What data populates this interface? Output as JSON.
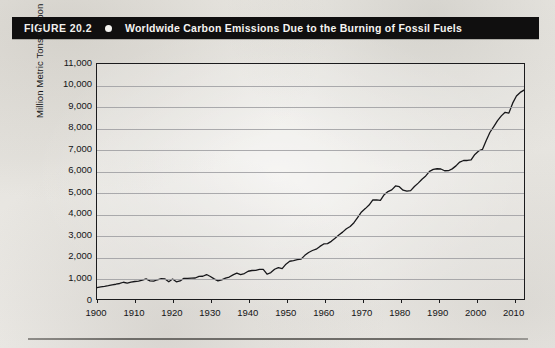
{
  "figure": {
    "number_label": "FIGURE 20.2",
    "bullet": "bullet-dot",
    "title": "Worldwide Carbon Emissions Due to the Burning of Fossil Fuels"
  },
  "colors": {
    "header_background": "#100f0f",
    "header_text": "#f6f5f2",
    "page_background": "#e9e7e2",
    "axis": "#1b1b1d",
    "gridline": "#9d9da1",
    "series_line": "#17171a"
  },
  "chart_data": {
    "type": "line",
    "title": "Worldwide Carbon Emissions Due to the Burning of Fossil Fuels",
    "xlabel": "",
    "ylabel": "Million Metric Tons Carbon",
    "xlim": [
      1900,
      2013
    ],
    "ylim": [
      0,
      11000
    ],
    "ytick_labels": [
      "0",
      "1,000",
      "2,000",
      "3,000",
      "4,000",
      "5,000",
      "6,000",
      "7,000",
      "8,000",
      "9,000",
      "10,000",
      "11,000"
    ],
    "ytick_values": [
      0,
      1000,
      2000,
      3000,
      4000,
      5000,
      6000,
      7000,
      8000,
      9000,
      10000,
      11000
    ],
    "xtick_labels": [
      "1900",
      "1910",
      "1920",
      "1930",
      "1940",
      "1950",
      "1960",
      "1970",
      "1980",
      "1990",
      "2000",
      "2010"
    ],
    "xtick_values": [
      1900,
      1910,
      1920,
      1930,
      1940,
      1950,
      1960,
      1970,
      1980,
      1990,
      2000,
      2010
    ],
    "grid": "horizontal",
    "legend": "none",
    "series": [
      {
        "name": "Worldwide carbon emissions from fossil fuels",
        "x": [
          1900,
          1901,
          1902,
          1903,
          1904,
          1905,
          1906,
          1907,
          1908,
          1909,
          1910,
          1911,
          1912,
          1913,
          1914,
          1915,
          1916,
          1917,
          1918,
          1919,
          1920,
          1921,
          1922,
          1923,
          1924,
          1925,
          1926,
          1927,
          1928,
          1929,
          1930,
          1931,
          1932,
          1933,
          1934,
          1935,
          1936,
          1937,
          1938,
          1939,
          1940,
          1941,
          1942,
          1943,
          1944,
          1945,
          1946,
          1947,
          1948,
          1949,
          1950,
          1951,
          1952,
          1953,
          1954,
          1955,
          1956,
          1957,
          1958,
          1959,
          1960,
          1961,
          1962,
          1963,
          1964,
          1965,
          1966,
          1967,
          1968,
          1969,
          1970,
          1971,
          1972,
          1973,
          1974,
          1975,
          1976,
          1977,
          1978,
          1979,
          1980,
          1981,
          1982,
          1983,
          1984,
          1985,
          1986,
          1987,
          1988,
          1989,
          1990,
          1991,
          1992,
          1993,
          1994,
          1995,
          1996,
          1997,
          1998,
          1999,
          2000,
          2001,
          2002,
          2003,
          2004,
          2005,
          2006,
          2007,
          2008,
          2009,
          2010,
          2011,
          2012,
          2013
        ],
        "values": [
          534,
          566,
          592,
          624,
          663,
          691,
          726,
          784,
          747,
          787,
          819,
          836,
          879,
          943,
          850,
          838,
          901,
          955,
          936,
          806,
          932,
          803,
          845,
          970,
          963,
          975,
          983,
          1062,
          1065,
          1145,
          1053,
          940,
          847,
          893,
          973,
          1027,
          1130,
          1209,
          1142,
          1192,
          1299,
          1334,
          1342,
          1391,
          1383,
          1160,
          1238,
          1392,
          1469,
          1419,
          1630,
          1767,
          1795,
          1841,
          1865,
          2043,
          2177,
          2270,
          2330,
          2462,
          2577,
          2594,
          2700,
          2848,
          2995,
          3130,
          3288,
          3393,
          3572,
          3824,
          4076,
          4231,
          4399,
          4635,
          4644,
          4615,
          4883,
          5029,
          5110,
          5292,
          5256,
          5093,
          5045,
          5072,
          5265,
          5424,
          5607,
          5760,
          5974,
          6067,
          6097,
          6085,
          6003,
          6005,
          6091,
          6231,
          6411,
          6483,
          6484,
          6508,
          6766,
          6929,
          6999,
          7424,
          7806,
          8073,
          8348,
          8572,
          8740,
          8700,
          9167,
          9500,
          9670,
          9776
        ]
      }
    ]
  }
}
